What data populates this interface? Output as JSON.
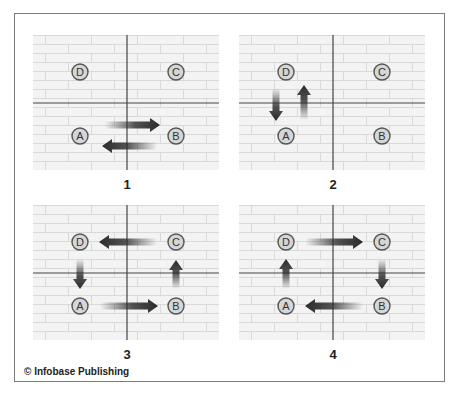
{
  "figure": {
    "credit": "© Infobase Publishing",
    "colors": {
      "background": "#f3f3f3",
      "brick_lines": "#d9d9d9",
      "axis": "#444444",
      "node_fill": "#d6d6d6",
      "node_border": "#555555",
      "arrow_head": "#2b2b2b"
    },
    "nodes": [
      "A",
      "B",
      "C",
      "D"
    ],
    "panels": [
      {
        "label": "1",
        "arrows": [
          {
            "from": "A",
            "to": "B",
            "desc": "A to B"
          },
          {
            "from": "B",
            "to": "A",
            "desc": "B to A"
          }
        ]
      },
      {
        "label": "2",
        "arrows": [
          {
            "from": "D",
            "to": "A",
            "desc": "D to A"
          },
          {
            "from": "A",
            "to": "D",
            "desc": "A to D"
          }
        ]
      },
      {
        "label": "3",
        "arrows": [
          {
            "from": "A",
            "to": "B"
          },
          {
            "from": "B",
            "to": "C"
          },
          {
            "from": "C",
            "to": "D"
          },
          {
            "from": "D",
            "to": "A"
          }
        ],
        "direction": "counterclockwise"
      },
      {
        "label": "4",
        "arrows": [
          {
            "from": "A",
            "to": "D"
          },
          {
            "from": "D",
            "to": "C"
          },
          {
            "from": "C",
            "to": "B"
          },
          {
            "from": "B",
            "to": "A"
          }
        ],
        "direction": "clockwise"
      }
    ]
  }
}
